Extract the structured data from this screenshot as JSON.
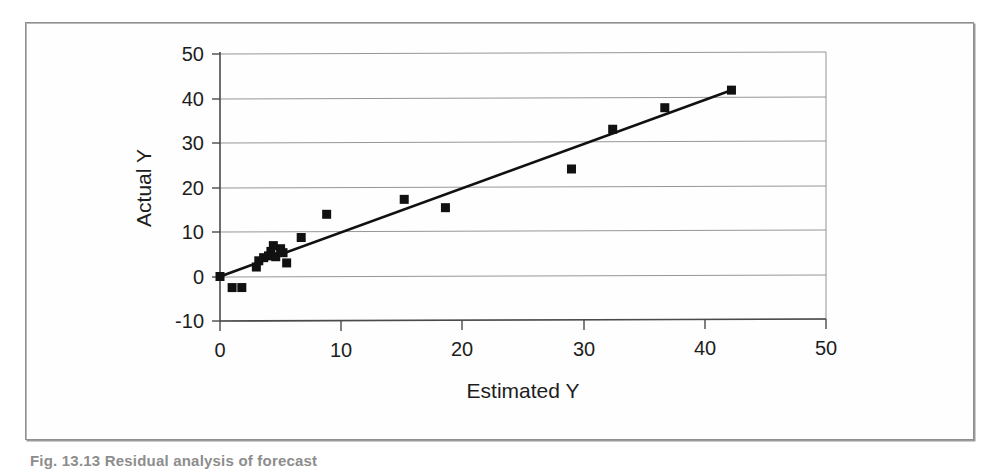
{
  "figure": {
    "caption": "Fig. 13.13  Residual analysis of forecast",
    "frame_color": "#8e8e8e"
  },
  "chart_data": {
    "type": "scatter",
    "title": "",
    "xlabel": "Estimated Y",
    "ylabel": "Actual Y",
    "xlim": [
      0,
      50
    ],
    "ylim": [
      -10,
      50
    ],
    "xticks": [
      0,
      10,
      20,
      30,
      40,
      50
    ],
    "yticks": [
      -10,
      0,
      10,
      20,
      30,
      40,
      50
    ],
    "xtick_labels": [
      "0",
      "10",
      "20",
      "30",
      "40",
      "50"
    ],
    "ytick_labels": [
      "-10",
      "0",
      "10",
      "20",
      "30",
      "40",
      "50"
    ],
    "grid": "horizontal",
    "legend": "none",
    "marker_color": "#111111",
    "marker_shape": "square",
    "line_color": "#111111",
    "series": [
      {
        "name": "Actual vs Estimated",
        "marker": "square",
        "points": [
          [
            0.0,
            0.0
          ],
          [
            1.0,
            -2.5
          ],
          [
            1.8,
            -2.5
          ],
          [
            3.0,
            2.1
          ],
          [
            3.2,
            3.5
          ],
          [
            3.6,
            4.2
          ],
          [
            4.0,
            4.6
          ],
          [
            4.2,
            5.6
          ],
          [
            4.4,
            6.9
          ],
          [
            4.6,
            4.4
          ],
          [
            5.0,
            6.2
          ],
          [
            5.2,
            5.3
          ],
          [
            5.5,
            3.0
          ],
          [
            6.7,
            8.7
          ],
          [
            8.8,
            13.9
          ],
          [
            15.2,
            17.2
          ],
          [
            18.6,
            15.3
          ],
          [
            29.0,
            23.9
          ],
          [
            32.4,
            32.8
          ],
          [
            36.7,
            37.6
          ],
          [
            42.2,
            41.5
          ]
        ]
      }
    ],
    "fit_line": {
      "name": "Regression fit",
      "start": [
        0.0,
        0.0
      ],
      "end": [
        42.2,
        41.5
      ]
    }
  }
}
